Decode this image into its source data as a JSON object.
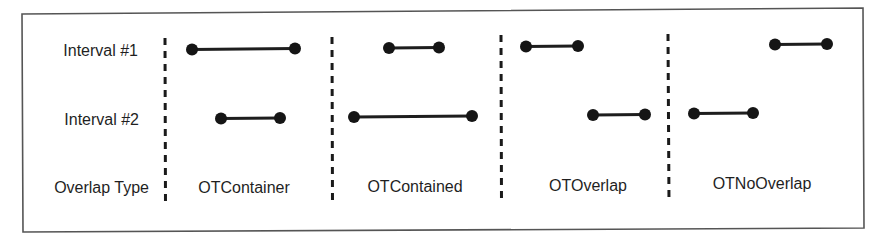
{
  "diagram": {
    "row_labels": [
      "Interval #1",
      "Interval #2",
      "Overlap Type"
    ],
    "columns": [
      {
        "type_label": "OTContainer",
        "interval1": {
          "x1": 192,
          "x2": 295
        },
        "interval2": {
          "x1": 221,
          "x2": 280
        }
      },
      {
        "type_label": "OTContained",
        "interval1": {
          "x1": 389,
          "x2": 439
        },
        "interval2": {
          "x1": 354,
          "x2": 472
        }
      },
      {
        "type_label": "OTOverlap",
        "interval1": {
          "x1": 526,
          "x2": 578
        },
        "interval2": {
          "x1": 593,
          "x2": 645
        }
      },
      {
        "type_label": "OTNoOverlap",
        "interval1": {
          "x1": 775,
          "x2": 827
        },
        "interval2": {
          "x1": 694,
          "x2": 753
        }
      }
    ],
    "colors": {
      "ink": "#151515",
      "frame": "#555555",
      "background": "#ffffff"
    }
  }
}
